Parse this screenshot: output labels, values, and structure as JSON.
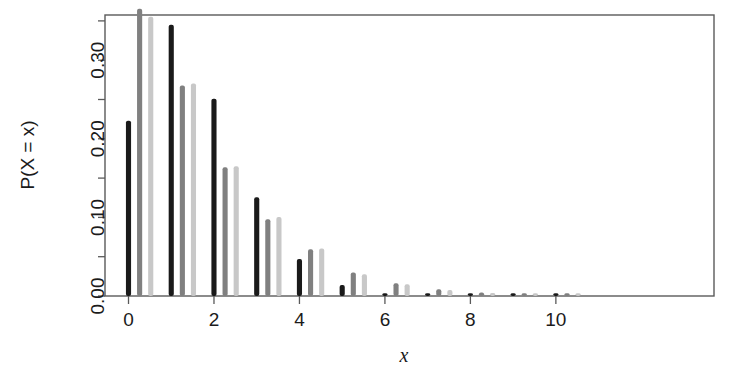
{
  "chart_data": {
    "type": "bar",
    "title": "",
    "subtitle": "",
    "xlabel": "x",
    "ylabel": "P(X = x)",
    "xlim": [
      -0.55,
      13.7
    ],
    "ylim": [
      0.0,
      0.3575
    ],
    "grid": false,
    "legend": "none",
    "x_ticks": [
      0,
      2,
      4,
      6,
      8,
      10
    ],
    "x_tick_labels": [
      "0",
      "2",
      "4",
      "6",
      "8",
      "10"
    ],
    "x_minor_ticks": [
      1,
      3,
      5,
      7,
      9
    ],
    "y_ticks": [
      0.0,
      0.1,
      0.2,
      0.3
    ],
    "y_tick_labels": [
      "0.00",
      "0.10",
      "0.20",
      "0.30"
    ],
    "y_minor_ticks": [
      0.05,
      0.15,
      0.25,
      0.35
    ],
    "categories": [
      0,
      1,
      2,
      3,
      4,
      5,
      6,
      7,
      8,
      9,
      10
    ],
    "series": [
      {
        "name": "series-1-black",
        "color": "#1a1a1a",
        "offset": 0.0,
        "values": [
          0.2231,
          0.3452,
          0.251,
          0.1255,
          0.0471,
          0.0141,
          0.0035,
          0.0008,
          0.0002,
          0.0001,
          0.0
        ]
      },
      {
        "name": "series-2-gray",
        "color": "#808080",
        "offset": 0.26,
        "values": [
          0.3653,
          0.2678,
          0.1637,
          0.0975,
          0.0595,
          0.0298,
          0.0161,
          0.0085,
          0.0046,
          0.0026,
          0.0014
        ]
      },
      {
        "name": "series-3-lightgray",
        "color": "#c8c8c8",
        "offset": 0.52,
        "values": [
          0.3553,
          0.2702,
          0.165,
          0.1006,
          0.0603,
          0.0277,
          0.015,
          0.0075,
          0.0038,
          0.0019,
          0.001
        ]
      }
    ],
    "bar_width_units": 0.12,
    "background": "#ffffff",
    "axis_color": "#5a5a5a",
    "text_color": "#1b1b1b"
  },
  "figure": {
    "width": 747,
    "height": 377,
    "plot_left": 105,
    "plot_right": 714,
    "plot_top": 15,
    "plot_bottom": 296
  }
}
